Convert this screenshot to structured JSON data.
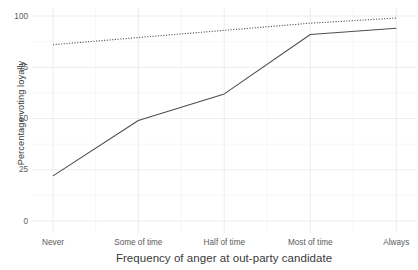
{
  "chart_data": {
    "type": "line",
    "title": "",
    "subtitle": "",
    "xlabel": "Frequency of anger at out-party candidate",
    "ylabel": "Percentage voting loyally",
    "categories": [
      "Never",
      "Some of time",
      "Half of time",
      "Most of time",
      "Always"
    ],
    "x_tick_labels": [
      "Never",
      "Some of time",
      "Half of time",
      "Most of time",
      "Always"
    ],
    "y_tick_labels": [
      "0",
      "25",
      "50",
      "75",
      "100"
    ],
    "y_ticks": [
      0,
      25,
      50,
      75,
      100
    ],
    "ylim": [
      0,
      100
    ],
    "grid": true,
    "legend": "none",
    "series": [
      {
        "name": "solid-line",
        "style": "solid",
        "color": "#4d4d4d",
        "values": [
          22,
          49,
          62,
          91,
          94
        ]
      },
      {
        "name": "dotted-line",
        "style": "dotted",
        "color": "#4d4d4d",
        "values": [
          86,
          89.5,
          93,
          96.5,
          99
        ]
      }
    ]
  },
  "axes": {
    "y_title": "Percentage voting loyally",
    "x_title": "Frequency of anger at out-party candidate"
  },
  "colors": {
    "line": "#4d4d4d",
    "grid_major": "#ebebeb",
    "grid_minor": "#f5f5f5",
    "text": "#4d4d4d",
    "background": "#ffffff"
  }
}
